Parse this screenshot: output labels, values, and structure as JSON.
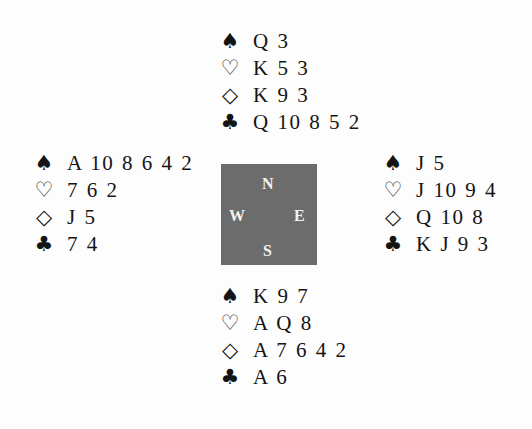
{
  "suits": {
    "spade": "♠",
    "heart": "♡",
    "diamond": "◇",
    "club": "♣"
  },
  "hands": {
    "north": {
      "spades": "Q 3",
      "hearts": "K 5 3",
      "diamonds": "K 9 3",
      "clubs": "Q 10 8 5 2"
    },
    "west": {
      "spades": "A 10 8 6 4 2",
      "hearts": "7 6 2",
      "diamonds": "J 5",
      "clubs": "7 4"
    },
    "east": {
      "spades": "J 5",
      "hearts": "J 10 9 4",
      "diamonds": "Q 10 8",
      "clubs": "K J 9 3"
    },
    "south": {
      "spades": "K 9 7",
      "hearts": "A Q 8",
      "diamonds": "A 7 6 4 2",
      "clubs": "A 6"
    }
  },
  "compass": {
    "north": "N",
    "west": "W",
    "east": "E",
    "south": "S",
    "color": "#6c6c6c"
  }
}
